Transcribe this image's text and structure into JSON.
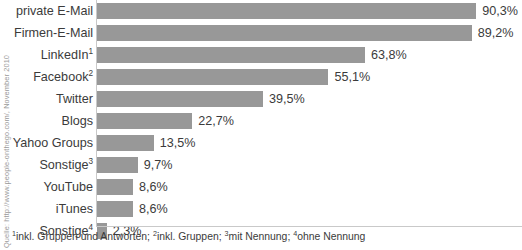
{
  "chart_data": {
    "type": "bar",
    "orientation": "horizontal",
    "title": "",
    "xlabel": "",
    "ylabel": "",
    "xlim": [
      0,
      100
    ],
    "grid": false,
    "legend": null,
    "bar_color": "#989898",
    "categories": [
      "private E-Mail",
      "Firmen-E-Mail",
      "LinkedIn",
      "Facebook",
      "Twitter",
      "Blogs",
      "Yahoo Groups",
      "Sonstige",
      "YouTube",
      "iTunes",
      "Sonstige"
    ],
    "category_footnote_marks": [
      "",
      "",
      "1",
      "2",
      "",
      "",
      "",
      "3",
      "",
      "",
      "4"
    ],
    "values": [
      90.3,
      89.2,
      63.8,
      55.1,
      39.5,
      22.7,
      13.5,
      9.7,
      8.6,
      8.6,
      2.3
    ],
    "value_labels": [
      "90,3%",
      "89,2%",
      "63,8%",
      "55,1%",
      "39,5%",
      "22,7%",
      "13,5%",
      "9,7%",
      "8,6%",
      "8,6%",
      "2,3%"
    ]
  },
  "source_credit": "Quelle: http://www.people-onthego.com/, November 2010",
  "footnotes": {
    "full_text": "¹inkl. Gruppen und Antworten; ²inkl. Gruppen; ³mit Nennung; ⁴ohne Nennung",
    "items": [
      {
        "mark": "1",
        "text": "inkl. Gruppen und Antworten;"
      },
      {
        "mark": "2",
        "text": "inkl. Gruppen;"
      },
      {
        "mark": "3",
        "text": "mit Nennung;"
      },
      {
        "mark": "4",
        "text": "ohne Nennung"
      }
    ]
  }
}
